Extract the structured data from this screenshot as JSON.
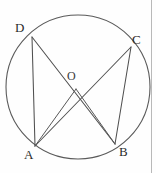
{
  "figure": {
    "background_color": "#fefefe",
    "stroke_color": "#5a5a5a",
    "label_color": "#2b2b2b",
    "border_color": "#b9b9b9",
    "canvas": {
      "width": 156,
      "height": 173
    },
    "circle": {
      "cx": 78,
      "cy": 87,
      "r": 72,
      "stroke_width": 1.1
    },
    "center_point": {
      "x": 76,
      "y": 89
    },
    "points": [
      {
        "id": "D",
        "label": "D",
        "x": 32,
        "y": 37,
        "label_x": 15,
        "label_y": 21
      },
      {
        "id": "C",
        "label": "C",
        "x": 131,
        "y": 47,
        "label_x": 132,
        "label_y": 33
      },
      {
        "id": "A",
        "label": "A",
        "x": 35,
        "y": 146,
        "label_x": 24,
        "label_y": 148
      },
      {
        "id": "B",
        "label": "B",
        "x": 115,
        "y": 144,
        "label_x": 119,
        "label_y": 145
      }
    ],
    "center": {
      "id": "O",
      "label": "O",
      "label_x": 67,
      "label_y": 70
    },
    "segments": [
      {
        "name": "chord-D-A",
        "from": "D",
        "to": "A",
        "x1": 32,
        "y1": 37,
        "x2": 35,
        "y2": 146
      },
      {
        "name": "chord-C-B",
        "from": "C",
        "to": "B",
        "x1": 131,
        "y1": 47,
        "x2": 115,
        "y2": 144
      },
      {
        "name": "chord-D-B",
        "from": "D",
        "to": "B",
        "x1": 32,
        "y1": 37,
        "x2": 115,
        "y2": 144
      },
      {
        "name": "chord-A-C",
        "from": "A",
        "to": "C",
        "x1": 35,
        "y1": 146,
        "x2": 131,
        "y2": 47
      },
      {
        "name": "radius-O-A",
        "from": "O",
        "to": "A",
        "x1": 76,
        "y1": 89,
        "x2": 35,
        "y2": 146
      },
      {
        "name": "radius-O-B",
        "from": "O",
        "to": "B",
        "x1": 76,
        "y1": 89,
        "x2": 115,
        "y2": 144
      }
    ],
    "right_border": {
      "x": 151,
      "y1": 0,
      "y2": 173
    }
  }
}
